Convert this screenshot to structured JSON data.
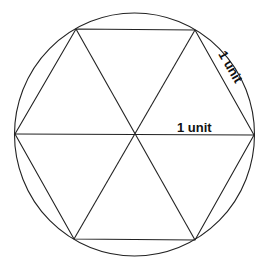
{
  "diagram": {
    "labels": {
      "side": "1 unit",
      "radius": "1 unit"
    },
    "colors": {
      "stroke": "#222222",
      "background": "#ffffff",
      "text": "#111111"
    }
  }
}
